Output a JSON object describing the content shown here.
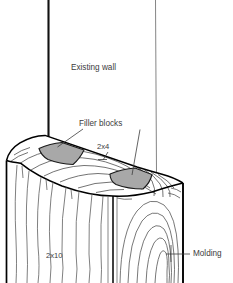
{
  "figure": {
    "type": "technical-line-drawing",
    "background_color": "#ffffff",
    "outline_color": "#000000",
    "grain_color": "#555555",
    "filler_block_fill": "#a8a8a8",
    "text_color": "#3c3c3c",
    "width": 233,
    "height": 283
  },
  "labels": {
    "existing_wall": "Existing wall",
    "filler_blocks": "Filler blocks",
    "two_by_four": "2x4",
    "two_by_ten": "2x10",
    "molding": "Molding"
  },
  "parts": [
    {
      "name": "existing-wall",
      "label": "Existing wall"
    },
    {
      "name": "filler-blocks",
      "label": "Filler blocks",
      "count": 2,
      "fill": "#a8a8a8"
    },
    {
      "name": "nailer-2x4",
      "label": "2x4"
    },
    {
      "name": "beam-2x10",
      "label": "2x10"
    },
    {
      "name": "molding",
      "label": "Molding"
    }
  ]
}
